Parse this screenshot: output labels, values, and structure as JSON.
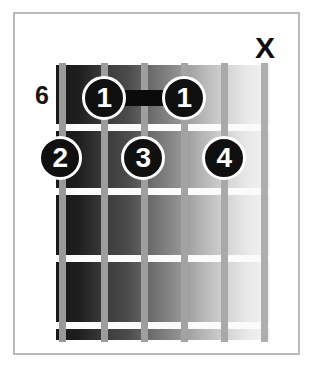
{
  "diagram": {
    "kind": "guitar-chord-diagram",
    "fret_position_label": "6",
    "string_count": 6,
    "fret_count": 4,
    "fretboard": {
      "gradient_start_color": "#181818",
      "gradient_end_color": "#f4f4f4",
      "fret_line_color": "#fbfbfb",
      "string_color": "#9a9a9a"
    },
    "string_markers": [
      {
        "string": 6,
        "symbol": "X",
        "meaning": "muted"
      }
    ],
    "barre": {
      "finger": "1",
      "fret": 1,
      "from_string": 1,
      "to_string": 4,
      "bar_color": "#0b0b0b"
    },
    "finger_dots": [
      {
        "label": "1",
        "string": 1,
        "fret": 1,
        "x": 104,
        "y": 98
      },
      {
        "label": "1",
        "string": 4,
        "fret": 1,
        "x": 184,
        "y": 98
      },
      {
        "label": "2",
        "string": 1,
        "fret": 2,
        "x": 60,
        "y": 158
      },
      {
        "label": "3",
        "string": 3,
        "fret": 2,
        "x": 143,
        "y": 158
      },
      {
        "label": "4",
        "string": 5,
        "fret": 2,
        "x": 224,
        "y": 158
      }
    ],
    "string_x_positions": [
      62,
      104,
      144,
      184,
      224,
      264
    ],
    "fret_line_y_positions": [
      124,
      188,
      255,
      322
    ],
    "dot_color": "#101010",
    "dot_text_color": "#ffffff",
    "label_color": "#141414",
    "frame_color": "#b9b9b9",
    "background_color": "#ffffff"
  }
}
